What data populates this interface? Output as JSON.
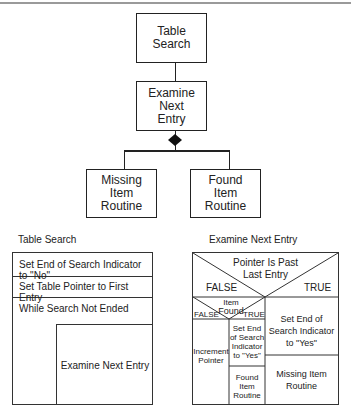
{
  "structure_chart": {
    "root": "Table Search",
    "child": "Examine Next Entry",
    "child_lines": [
      "Examine",
      "Next",
      "Entry"
    ],
    "root_lines": [
      "Table",
      "Search"
    ],
    "leaves": [
      {
        "lines": [
          "Missing",
          "Item",
          "Routine"
        ]
      },
      {
        "lines": [
          "Found",
          "Item",
          "Routine"
        ]
      }
    ]
  },
  "left_diagram": {
    "title": "Table Search",
    "rows": [
      "Set End of Search Indicator to \"No\"",
      "Set Table Pointer to First Entry",
      "While Search Not Ended"
    ],
    "loop_body": "Examine Next Entry"
  },
  "right_diagram": {
    "title": "Examine Next Entry",
    "condition": [
      "Pointer Is Past",
      "Last Entry"
    ],
    "false_label": "FALSE",
    "true_label": "TRUE",
    "inner_condition": [
      "Item",
      "Found"
    ],
    "inner_false": "FALSE",
    "inner_true": "TRUE",
    "inner_false_action": [
      "Increment",
      "Pointer"
    ],
    "inner_true_actions": [
      [
        "Set End",
        "of Search",
        "Indicator",
        "to \"Yes\""
      ],
      [
        "Found",
        "Item",
        "Routine"
      ]
    ],
    "true_actions": [
      [
        "Set End of",
        "Search Indicator",
        "to \"Yes\""
      ],
      [
        "Missing Item",
        "Routine"
      ]
    ]
  }
}
